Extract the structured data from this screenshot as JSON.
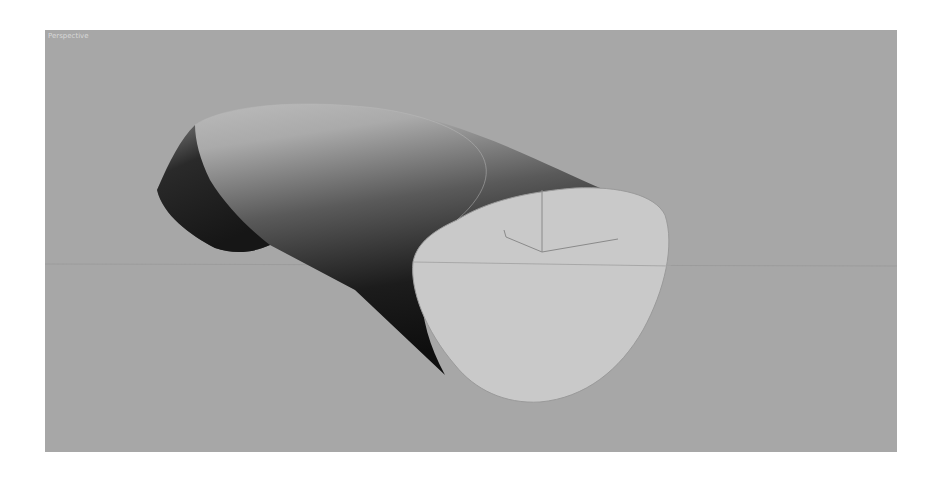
{
  "viewport": {
    "label": "Perspective",
    "background_color": "#a7a7a7"
  },
  "scene": {
    "object": "cylinder",
    "cap_color": "#c9c9c9",
    "grid_line_color": "#999999",
    "gizmo_color": "#8a8a8a"
  }
}
